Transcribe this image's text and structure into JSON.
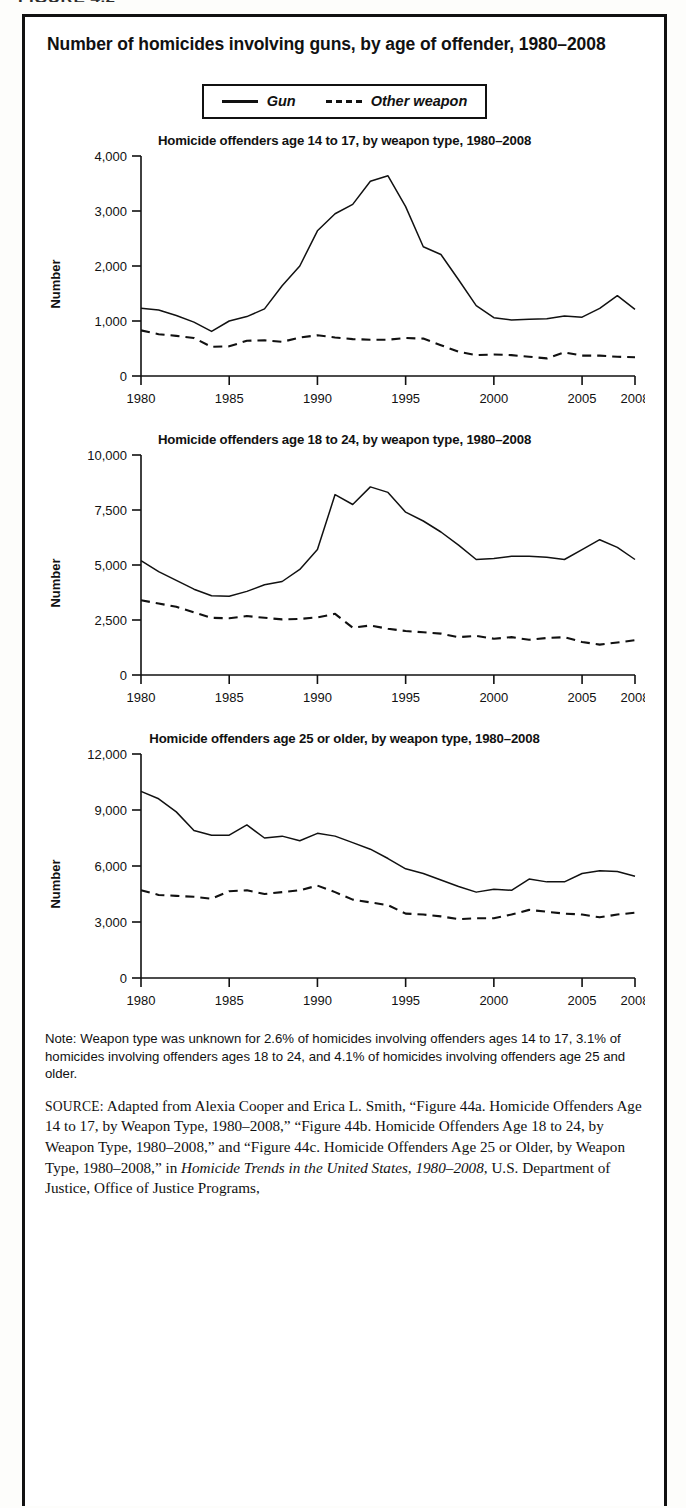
{
  "figure_header": "FIGURE 4.2",
  "figure": {
    "title": "Number of homicides involving guns, by age of offender, 1980–2008"
  },
  "legend": {
    "items": [
      {
        "label": "Gun",
        "style": "solid"
      },
      {
        "label": "Other weapon",
        "style": "dashed"
      }
    ]
  },
  "note": {
    "text": "Note: Weapon type was unknown for 2.6% of homicides involving offenders ages 14 to 17,  3.1% of homicides involving offenders ages 18 to 24, and 4.1% of homicides involving offenders age 25 and older."
  },
  "source": {
    "label": "SOURCE:",
    "body_1": " Adapted from Alexia Cooper and Erica L. Smith, “Figure 44a. Homicide Offenders Age 14 to 17, by Weapon Type, 1980–2008,” “Figure 44b. Homicide Offenders Age 18 to 24, by Weapon Type, 1980–2008,” and “Figure 44c. Homicide Offenders Age 25 or Older, by Weapon Type, 1980–2008,” in ",
    "italic_title": "Homicide Trends in the United States, 1980–2008",
    "body_2": ", U.S. Department of Justice, Office of Justice Programs,"
  },
  "chart_data": [
    {
      "type": "line",
      "title": "Homicide offenders age 14 to 17, by weapon type,  1980–2008",
      "xlabel": "",
      "ylabel": "Number",
      "ylim": [
        0,
        4000
      ],
      "yticks": [
        0,
        1000,
        2000,
        3000,
        4000
      ],
      "ytick_labels": [
        "0",
        "1,000",
        "2,000",
        "3,000",
        "4,000"
      ],
      "xlim": [
        1980,
        2008
      ],
      "xticks": [
        1980,
        1985,
        1990,
        1995,
        2000,
        2005,
        2008
      ],
      "xtick_labels": [
        "1980",
        "1985",
        "1990",
        "1995",
        "2000",
        "2005",
        "2008"
      ],
      "grid": false,
      "legend_position": "top-external",
      "x": [
        1980,
        1981,
        1982,
        1983,
        1984,
        1985,
        1986,
        1987,
        1988,
        1989,
        1990,
        1991,
        1992,
        1993,
        1994,
        1995,
        1996,
        1997,
        1998,
        1999,
        2000,
        2001,
        2002,
        2003,
        2004,
        2005,
        2006,
        2007,
        2008
      ],
      "series": [
        {
          "name": "Gun",
          "style": "solid",
          "values": [
            1230,
            1200,
            1100,
            980,
            810,
            1000,
            1080,
            1220,
            1640,
            2000,
            2640,
            2950,
            3120,
            3540,
            3640,
            3080,
            2350,
            2210,
            1750,
            1280,
            1060,
            1020,
            1030,
            1040,
            1090,
            1070,
            1230,
            1460,
            1210
          ]
        },
        {
          "name": "Other weapon",
          "style": "dashed",
          "values": [
            830,
            760,
            730,
            690,
            530,
            540,
            640,
            650,
            620,
            700,
            740,
            700,
            670,
            660,
            660,
            690,
            680,
            560,
            440,
            380,
            390,
            380,
            350,
            320,
            430,
            370,
            370,
            350,
            340
          ]
        }
      ]
    },
    {
      "type": "line",
      "title": "Homicide offenders age 18 to 24, by weapon type,  1980–2008",
      "xlabel": "",
      "ylabel": "Number",
      "ylim": [
        0,
        10000
      ],
      "yticks": [
        0,
        2500,
        5000,
        7500,
        10000
      ],
      "ytick_labels": [
        "0",
        "2,500",
        "5,000",
        "7,500",
        "10,000"
      ],
      "xlim": [
        1980,
        2008
      ],
      "xticks": [
        1980,
        1985,
        1990,
        1995,
        2000,
        2005,
        2008
      ],
      "xtick_labels": [
        "1980",
        "1985",
        "1990",
        "1995",
        "2000",
        "2005",
        "2008"
      ],
      "grid": false,
      "legend_position": "top-external",
      "x": [
        1980,
        1981,
        1982,
        1983,
        1984,
        1985,
        1986,
        1987,
        1988,
        1989,
        1990,
        1991,
        1992,
        1993,
        1994,
        1995,
        1996,
        1997,
        1998,
        1999,
        2000,
        2001,
        2002,
        2003,
        2004,
        2005,
        2006,
        2007,
        2008
      ],
      "series": [
        {
          "name": "Gun",
          "style": "solid",
          "values": [
            5200,
            4700,
            4300,
            3900,
            3600,
            3580,
            3800,
            4100,
            4250,
            4800,
            5700,
            8200,
            7750,
            8550,
            8300,
            7400,
            7000,
            6500,
            5900,
            5250,
            5300,
            5400,
            5400,
            5350,
            5250,
            5700,
            6150,
            5800,
            5250
          ]
        },
        {
          "name": "Other weapon",
          "style": "dashed",
          "values": [
            3400,
            3250,
            3100,
            2850,
            2600,
            2580,
            2680,
            2600,
            2530,
            2550,
            2620,
            2780,
            2150,
            2250,
            2100,
            2000,
            1940,
            1880,
            1720,
            1780,
            1650,
            1720,
            1600,
            1680,
            1720,
            1500,
            1380,
            1480,
            1580
          ]
        }
      ]
    },
    {
      "type": "line",
      "title": "Homicide offenders age 25 or older, by weapon type,  1980–2008",
      "xlabel": "",
      "ylabel": "Number",
      "ylim": [
        0,
        12000
      ],
      "yticks": [
        0,
        3000,
        6000,
        9000,
        12000
      ],
      "ytick_labels": [
        "0",
        "3,000",
        "6,000",
        "9,000",
        "12,000"
      ],
      "xlim": [
        1980,
        2008
      ],
      "xticks": [
        1980,
        1985,
        1990,
        1995,
        2000,
        2005,
        2008
      ],
      "xtick_labels": [
        "1980",
        "1985",
        "1990",
        "1995",
        "2000",
        "2005",
        "2008"
      ],
      "grid": false,
      "legend_position": "top-external",
      "x": [
        1980,
        1981,
        1982,
        1983,
        1984,
        1985,
        1986,
        1987,
        1988,
        1989,
        1990,
        1991,
        1992,
        1993,
        1994,
        1995,
        1996,
        1997,
        1998,
        1999,
        2000,
        2001,
        2002,
        2003,
        2004,
        2005,
        2006,
        2007,
        2008
      ],
      "series": [
        {
          "name": "Gun",
          "style": "solid",
          "values": [
            10000,
            9600,
            8900,
            7900,
            7650,
            7650,
            8200,
            7500,
            7600,
            7350,
            7750,
            7600,
            7250,
            6900,
            6400,
            5850,
            5600,
            5250,
            4900,
            4600,
            4750,
            4700,
            5300,
            5150,
            5150,
            5600,
            5750,
            5700,
            5450
          ]
        },
        {
          "name": "Other weapon",
          "style": "dashed",
          "values": [
            4700,
            4450,
            4400,
            4350,
            4250,
            4650,
            4700,
            4500,
            4600,
            4700,
            4950,
            4600,
            4200,
            4050,
            3900,
            3450,
            3400,
            3300,
            3150,
            3200,
            3200,
            3400,
            3650,
            3550,
            3450,
            3400,
            3250,
            3400,
            3500
          ]
        }
      ]
    }
  ]
}
